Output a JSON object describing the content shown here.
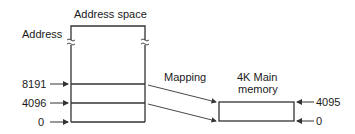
{
  "diagram": {
    "address_space_title": "Address space",
    "address_label": "Address",
    "mapping_label": "Mapping",
    "main_memory_title_line1": "4K Main",
    "main_memory_title_line2": "memory",
    "left_ticks": [
      "8191",
      "4096",
      "0"
    ],
    "right_ticks": [
      "4095",
      "0"
    ],
    "colors": {
      "line": "#333333",
      "text": "#1a1a1a",
      "background": "#ffffff"
    }
  }
}
